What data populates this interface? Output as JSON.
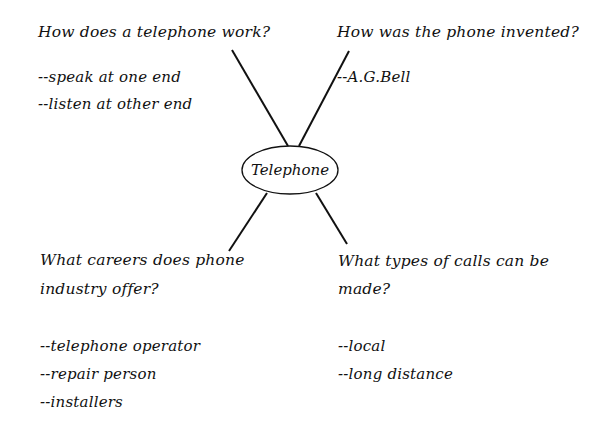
{
  "center": {
    "label": "Telephone"
  },
  "branches": [
    {
      "question": "How does a telephone work?",
      "answers": [
        "--speak at one end",
        "--listen at other end"
      ]
    },
    {
      "question": "How was the phone invented?",
      "answers": [
        "--A.G.Bell"
      ]
    },
    {
      "question_lines": [
        "What careers does phone",
        "industry offer?"
      ],
      "answers": [
        "--telephone operator",
        "--repair person",
        "--installers"
      ]
    },
    {
      "question_lines": [
        "What types of calls can be",
        "made?"
      ],
      "answers": [
        "--local",
        "--long distance"
      ]
    }
  ],
  "colors": {
    "ink": "#111111",
    "background": "#ffffff"
  }
}
